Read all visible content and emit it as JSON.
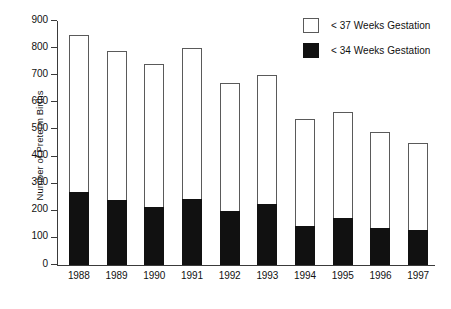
{
  "chart_data": {
    "type": "bar",
    "subtype": "stacked-vertical",
    "title": "",
    "xlabel": "",
    "ylabel": "Number of Preterm Births",
    "ylim": [
      0,
      900
    ],
    "yticks": [
      0,
      100,
      200,
      300,
      400,
      500,
      600,
      700,
      800,
      900
    ],
    "ytick_labels": [
      "0",
      "100",
      "200",
      "300",
      "400",
      "500",
      "600",
      "700",
      "800",
      "900"
    ],
    "grid": false,
    "legend_position": "top-right",
    "categories": [
      "1988",
      "1989",
      "1990",
      "1991",
      "1992",
      "1993",
      "1994",
      "1995",
      "1996",
      "1997"
    ],
    "series": [
      {
        "name": "< 37 Weeks Gestation",
        "note": "total bar height (cumulative, includes < 34 weeks segment)",
        "color": "#ffffff",
        "edge_color": "#5a5a5a",
        "values": [
          850,
          790,
          740,
          800,
          670,
          700,
          540,
          565,
          490,
          450
        ]
      },
      {
        "name": "< 34 Weeks Gestation",
        "note": "black filled lower segment",
        "color": "#111111",
        "edge_color": "#111111",
        "values": [
          270,
          240,
          215,
          245,
          200,
          225,
          145,
          175,
          135,
          130
        ]
      }
    ]
  },
  "axis": {
    "y_label": "Number of Preterm Births",
    "y_ticks": [
      "900",
      "800",
      "700",
      "600",
      "500",
      "400",
      "300",
      "200",
      "100",
      "0"
    ],
    "x_labels": [
      "1988",
      "1989",
      "1990",
      "1991",
      "1992",
      "1993",
      "1994",
      "1995",
      "1996",
      "1997"
    ]
  },
  "legend": {
    "items": [
      {
        "label": "< 37 Weeks Gestation",
        "swatch": "open-square"
      },
      {
        "label": "< 34 Weeks Gestation",
        "swatch": "filled-square"
      }
    ]
  },
  "caption": {
    "text": ""
  },
  "colors": {
    "bar_fill_open": "#ffffff",
    "bar_fill_solid": "#111111",
    "bar_edge": "#5a5a5a",
    "axis": "#3a3a3a",
    "text": "#111111",
    "background": "#ffffff"
  }
}
